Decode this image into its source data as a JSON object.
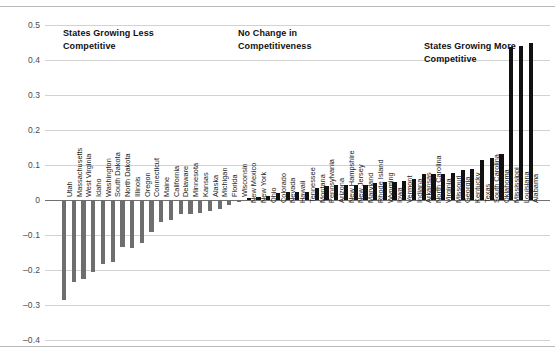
{
  "figure": {
    "background_color": "#ffffff",
    "negative_bar_color": "#6e6e6e",
    "positive_bar_color": "#111111",
    "gridline_color": "#d2d2d2",
    "zero_line_color": "#707070"
  },
  "annotations": [
    {
      "name": "annotation-less-competitive",
      "text": "States Growing Less\nCompetitive",
      "x": 63,
      "y": 27
    },
    {
      "name": "annotation-no-change",
      "text": "No Change in\nCompetitiveness",
      "x": 238,
      "y": 27
    },
    {
      "name": "annotation-more-competitive",
      "text": "States Growing More\nCompetitive",
      "x": 424,
      "y": 40
    }
  ],
  "chart_data": {
    "type": "bar",
    "title": "",
    "subtitle": "",
    "xlabel": "",
    "ylabel": "",
    "ylim": [
      -0.4,
      0.5
    ],
    "yticks": [
      0.5,
      0.4,
      0.3,
      0.2,
      0.1,
      0,
      -0.1,
      -0.2,
      -0.3,
      -0.4
    ],
    "ytick_labels": [
      "0.5",
      "0.4",
      "0.3",
      "0.2",
      "0.1",
      "0",
      "–0.1",
      "–0.2",
      "–0.3",
      "–0.4"
    ],
    "grid": true,
    "legend": "none",
    "orientation": "vertical",
    "categories": [
      "Utah",
      "Massachusetts",
      "West Virginia",
      "Idaho",
      "Washington",
      "South Dakota",
      "North Dakota",
      "Illinois",
      "Oregon",
      "Connecticut",
      "Maine",
      "California",
      "Delaware",
      "Minnesota",
      "Kansas",
      "Alaska",
      "Michigan",
      "Florida",
      "Wisconsin",
      "New Mexico",
      "New York",
      "Ohio",
      "Colorado",
      "Nevada",
      "Hawaii",
      "Tennessee",
      "Montana",
      "Pennsylvania",
      "Arizona",
      "New Hampshire",
      "New Jersey",
      "Maryland",
      "Rhode Island",
      "Wyoming",
      "Iowa",
      "Vermont",
      "Indiana",
      "Arkansas",
      "North Carolina",
      "Virginia",
      "Missouri",
      "Georgia",
      "Kentucky",
      "Texas",
      "South Carolina",
      "Oklahoma",
      "Mississippi",
      "Louisiana",
      "Alabama"
    ],
    "values": [
      -0.285,
      -0.235,
      -0.225,
      -0.205,
      -0.182,
      -0.178,
      -0.135,
      -0.137,
      -0.124,
      -0.092,
      -0.063,
      -0.056,
      -0.041,
      -0.04,
      -0.036,
      -0.031,
      -0.027,
      -0.013,
      -0.005,
      0.005,
      0.008,
      0.012,
      0.019,
      0.023,
      0.024,
      0.024,
      0.034,
      0.041,
      0.042,
      0.042,
      0.043,
      0.043,
      0.049,
      0.051,
      0.052,
      0.053,
      0.061,
      0.073,
      0.074,
      0.075,
      0.077,
      0.085,
      0.089,
      0.114,
      0.119,
      0.131,
      0.437,
      0.439,
      0.449
    ]
  }
}
